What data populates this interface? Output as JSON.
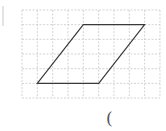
{
  "diagram": {
    "type": "grid-figure",
    "shape": "parallelogram",
    "grid": {
      "columns": 9,
      "rows": 6,
      "origin_x": 22,
      "origin_y": 10,
      "cell_w": 15.33,
      "cell_h": 14.67,
      "line_color": "#c8c8c8",
      "line_style": "dashed"
    },
    "parallelogram_grid_vertices": [
      [
        4,
        1
      ],
      [
        8,
        1
      ],
      [
        5,
        5
      ],
      [
        1,
        5
      ]
    ],
    "stroke_color": "#3a3a3a"
  },
  "answer_blank": {
    "text": "("
  }
}
